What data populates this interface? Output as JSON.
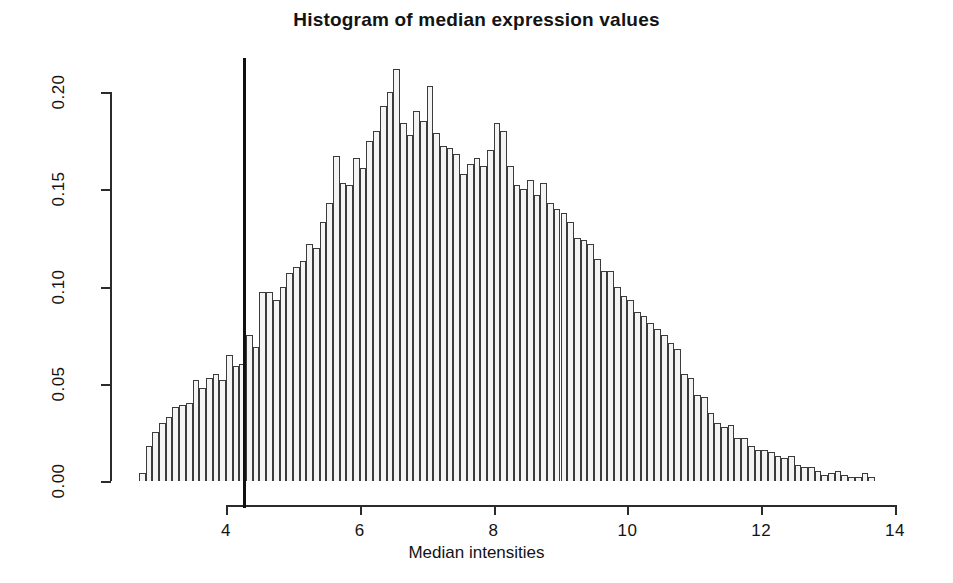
{
  "chart_data": {
    "type": "bar",
    "title": "Histogram of median expression values",
    "xlabel": "Median intensities",
    "ylabel": "",
    "xlim": [
      2.7,
      13.7
    ],
    "ylim": [
      0.0,
      0.212
    ],
    "grid": false,
    "legend": null,
    "bin_width": 0.1,
    "xticks": [
      4,
      6,
      8,
      10,
      12,
      14
    ],
    "xtick_labels": [
      "4",
      "6",
      "8",
      "10",
      "12",
      "14"
    ],
    "yticks": [
      0.0,
      0.05,
      0.1,
      0.15,
      0.2
    ],
    "ytick_labels": [
      "0.00",
      "0.05",
      "0.10",
      "0.15",
      "0.20"
    ],
    "bar_fill": "#f4f4f4",
    "bar_edge": "#3b3b3b",
    "annotations": [
      {
        "name": "threshold-line",
        "type": "vline",
        "x": 4.27,
        "color": "#101010",
        "width_px": 3
      }
    ],
    "bin_starts": [
      2.7,
      2.8,
      2.9,
      3.0,
      3.1,
      3.2,
      3.3,
      3.4,
      3.5,
      3.6,
      3.7,
      3.8,
      3.9,
      4.0,
      4.1,
      4.2,
      4.3,
      4.4,
      4.5,
      4.6,
      4.7,
      4.8,
      4.9,
      5.0,
      5.1,
      5.2,
      5.3,
      5.4,
      5.5,
      5.6,
      5.7,
      5.8,
      5.9,
      6.0,
      6.1,
      6.2,
      6.3,
      6.4,
      6.5,
      6.6,
      6.7,
      6.8,
      6.9,
      7.0,
      7.1,
      7.2,
      7.3,
      7.4,
      7.5,
      7.6,
      7.7,
      7.8,
      7.9,
      8.0,
      8.1,
      8.2,
      8.3,
      8.4,
      8.5,
      8.6,
      8.7,
      8.8,
      8.9,
      9.0,
      9.1,
      9.2,
      9.3,
      9.4,
      9.5,
      9.6,
      9.7,
      9.8,
      9.9,
      10.0,
      10.1,
      10.2,
      10.3,
      10.4,
      10.5,
      10.6,
      10.7,
      10.8,
      10.9,
      11.0,
      11.1,
      11.2,
      11.3,
      11.4,
      11.5,
      11.6,
      11.7,
      11.8,
      11.9,
      12.0,
      12.1,
      12.2,
      12.3,
      12.4,
      12.5,
      12.6,
      12.7,
      12.8,
      12.9,
      13.0,
      13.1,
      13.2,
      13.3,
      13.4,
      13.5,
      13.6
    ],
    "densities": [
      0.004,
      0.018,
      0.025,
      0.03,
      0.033,
      0.038,
      0.039,
      0.04,
      0.052,
      0.048,
      0.053,
      0.055,
      0.052,
      0.065,
      0.059,
      0.06,
      0.075,
      0.069,
      0.097,
      0.097,
      0.093,
      0.1,
      0.107,
      0.11,
      0.113,
      0.122,
      0.12,
      0.133,
      0.143,
      0.167,
      0.153,
      0.152,
      0.166,
      0.161,
      0.175,
      0.18,
      0.193,
      0.2,
      0.212,
      0.184,
      0.178,
      0.19,
      0.185,
      0.203,
      0.179,
      0.172,
      0.171,
      0.168,
      0.158,
      0.163,
      0.166,
      0.162,
      0.17,
      0.184,
      0.18,
      0.162,
      0.152,
      0.15,
      0.155,
      0.147,
      0.153,
      0.143,
      0.14,
      0.138,
      0.133,
      0.125,
      0.124,
      0.122,
      0.114,
      0.108,
      0.108,
      0.1,
      0.095,
      0.093,
      0.087,
      0.085,
      0.081,
      0.078,
      0.075,
      0.071,
      0.068,
      0.055,
      0.053,
      0.044,
      0.043,
      0.035,
      0.03,
      0.028,
      0.029,
      0.022,
      0.022,
      0.018,
      0.016,
      0.016,
      0.015,
      0.013,
      0.012,
      0.013,
      0.008,
      0.007,
      0.007,
      0.005,
      0.003,
      0.004,
      0.005,
      0.003,
      0.002,
      0.002,
      0.004,
      0.002
    ]
  }
}
